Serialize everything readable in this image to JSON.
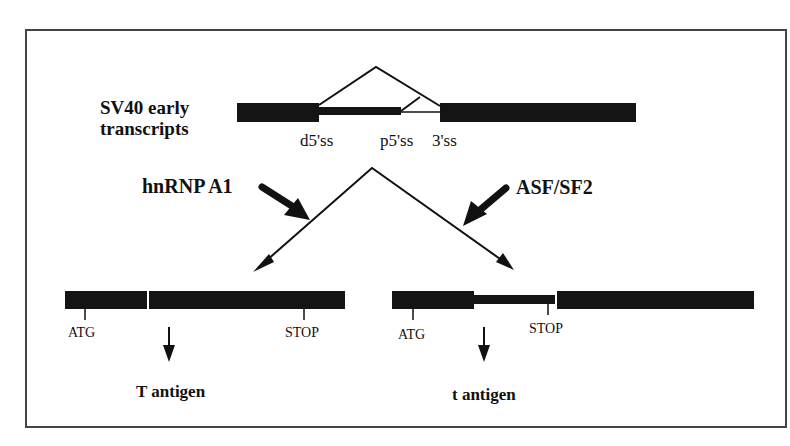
{
  "figure": {
    "title_line1": "SV40 early",
    "title_line2": "transcripts",
    "splice_sites": {
      "distal_5ss": "d5'ss",
      "proximal_5ss": "p5'ss",
      "three_ss": "3'ss"
    },
    "factors": {
      "left": "hnRNP A1",
      "right": "ASF/SF2"
    },
    "left_mrna": {
      "start_codon": "ATG",
      "stop_codon": "STOP",
      "product": "T antigen"
    },
    "right_mrna": {
      "start_codon": "ATG",
      "stop_codon": "STOP",
      "product": "t antigen"
    },
    "colors": {
      "exon": "#141414",
      "line": "#111111",
      "border": "#444444"
    }
  }
}
